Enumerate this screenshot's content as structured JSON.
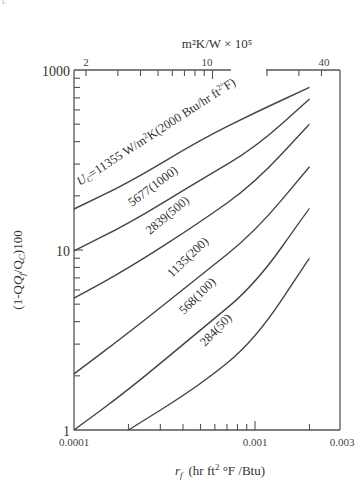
{
  "corner_note": "c",
  "chart_data": {
    "type": "line",
    "title": "",
    "xlabel": "r_f  (hr ft² °F /Btu)",
    "ylabel": "(1-Q_f/Q_C)100",
    "top_xlabel": "m²K/W × 10⁵",
    "xscale": "log",
    "yscale": "log",
    "xlim": [
      0.0001,
      0.003
    ],
    "ylim_labels": [
      "1",
      "10",
      "1000"
    ],
    "x_ticks": [
      0.0001,
      0.001,
      0.003
    ],
    "x_tick_labels": [
      "0.0001",
      "0.001",
      "0.003"
    ],
    "top_x_ticks": [
      2,
      10,
      40
    ],
    "top_x_tick_labels": [
      "2",
      "10",
      "40"
    ],
    "y_tick_labels": [
      {
        "label": "1000",
        "py": 70
      },
      {
        "label": "10",
        "py": 250
      },
      {
        "label": "1",
        "py": 430
      }
    ],
    "grid": false,
    "legend": "inline curve labels",
    "x": [
      0.0001,
      0.0002,
      0.0005,
      0.001,
      0.002
    ],
    "series": [
      {
        "name": "U_C=11355 W/m²K(2000 Btu/hr ft² °F)",
        "values": [
          16.9,
          23.6,
          41,
          58,
          80
        ]
      },
      {
        "name": "5677(1000)",
        "values": [
          9.9,
          14,
          24.5,
          36.9,
          69
        ]
      },
      {
        "name": "2839(500)",
        "values": [
          5.4,
          7.9,
          14.3,
          23.6,
          50
        ]
      },
      {
        "name": "1135(200)",
        "values": [
          2.05,
          3.46,
          7.2,
          12.6,
          29
        ]
      },
      {
        "name": "568(100)",
        "values": [
          1.0,
          1.67,
          3.6,
          6.4,
          17.1
        ]
      },
      {
        "name": "284(50)",
        "values": [
          null,
          1.0,
          1.78,
          3.16,
          9.0
        ]
      }
    ]
  },
  "labels": {
    "top_axis_title": "m²K/W  ×  10⁵",
    "top_axis_title_base": "m",
    "bottom_axis_rf": "r",
    "bottom_axis_sub": "f",
    "bottom_axis_units": "(hr ft",
    "bottom_axis_units2": "2",
    "bottom_axis_units3": " °F /Btu)",
    "y_axis_title_a": "(1-Q",
    "y_axis_title_sub1": "f",
    "y_axis_title_b": "/Q",
    "y_axis_title_sub2": "C",
    "y_axis_title_c": ")100",
    "curve1_a": "U",
    "curve1_sub": "C",
    "curve1_b": "=11355 W/m",
    "curve1_sup": "2",
    "curve1_c": "K(2000 Btu/hr ft",
    "curve1_sup2": "2°",
    "curve1_d": "F)",
    "curve2": "5677(1000)",
    "curve3": "2839(500)",
    "curve4": "1135(200)",
    "curve5": "568(100)",
    "curve6": "284(50)"
  }
}
